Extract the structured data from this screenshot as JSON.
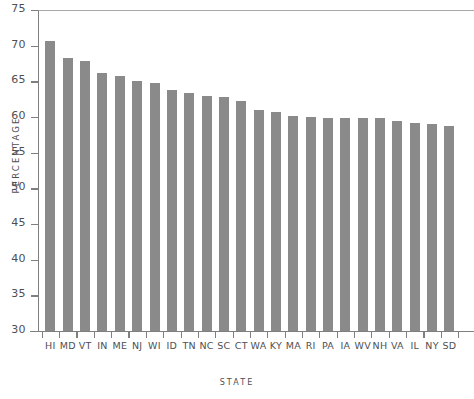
{
  "chart_data": {
    "type": "bar",
    "title": "",
    "xlabel": "STATE",
    "ylabel": "PERCENTAGE",
    "ylim": [
      30,
      75
    ],
    "yticks": [
      30,
      35,
      40,
      45,
      50,
      55,
      60,
      65,
      70,
      75
    ],
    "grid": false,
    "legend": null,
    "bar_color": "#8a8a8a",
    "axis_color": "#7f7f82",
    "text_color": "#4f4f52",
    "categories": [
      "HI",
      "MD",
      "VT",
      "IN",
      "ME",
      "NJ",
      "WI",
      "ID",
      "TN",
      "NC",
      "SC",
      "CT",
      "WA",
      "KY",
      "MA",
      "RI",
      "PA",
      "IA",
      "WV",
      "NH",
      "VA",
      "IL",
      "NY",
      "SD"
    ],
    "values": [
      70.7,
      68.3,
      67.8,
      66.2,
      65.7,
      65.0,
      64.7,
      63.8,
      63.4,
      63.0,
      62.8,
      62.2,
      61.0,
      60.7,
      60.1,
      60.0,
      59.9,
      59.9,
      59.8,
      59.8,
      59.5,
      59.1,
      59.0,
      58.8
    ],
    "note": "last bar (SD) is clipped at the right edge of the image"
  },
  "axes": {
    "y_title": "PERCENTAGE",
    "x_title": "STATE",
    "y_tick_labels": [
      "75",
      "70",
      "65",
      "60",
      "55",
      "50",
      "45",
      "40",
      "35",
      "30"
    ]
  }
}
